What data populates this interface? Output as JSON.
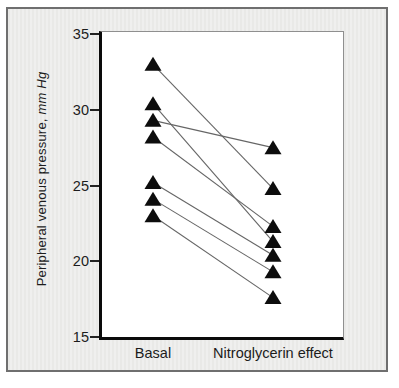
{
  "figure": {
    "background_color": "#eaeae8",
    "frame_border_color": "#6f6f6f",
    "axis_color": "#0a0a0a"
  },
  "chart_data": {
    "type": "line",
    "subtype": "paired-slope-chart",
    "categories": [
      "Basal",
      "Nitroglycerin effect"
    ],
    "ylabel_main": "Peripheral venous pressure, ",
    "ylabel_units": "mm Hg",
    "ylabel_units_italic": true,
    "ylim": [
      15,
      35
    ],
    "yticks": [
      35,
      30,
      25,
      20,
      15
    ],
    "grid": false,
    "legend": false,
    "marker": "filled-triangle-up",
    "marker_color": "#0d0d0d",
    "line_color": "#666666",
    "pairs": [
      {
        "basal": 33.0,
        "nitroglycerin": 24.8
      },
      {
        "basal": 30.4,
        "nitroglycerin": 21.3
      },
      {
        "basal": 29.3,
        "nitroglycerin": 27.5
      },
      {
        "basal": 28.2,
        "nitroglycerin": 22.3
      },
      {
        "basal": 25.2,
        "nitroglycerin": 20.4
      },
      {
        "basal": 24.1,
        "nitroglycerin": 19.3
      },
      {
        "basal": 23.0,
        "nitroglycerin": 17.6
      }
    ]
  }
}
